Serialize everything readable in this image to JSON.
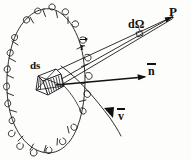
{
  "figure": {
    "background_color": "#fdfdfb",
    "ink_color": "#111111",
    "width": 191,
    "height": 161,
    "labels": {
      "point_p": "P",
      "solid_angle": "dΩ",
      "radius_vector": "r",
      "surface_element": "ds",
      "normal_vector": "n",
      "velocity_vector": "v"
    },
    "elements": {
      "loop": "scalloped-ellipse-loop",
      "surface_patch": "hatched-parallelogram",
      "cone": "narrow-cone-to-p",
      "aperture": "small-square-aperture",
      "normal_arrow": "horizontal-arrow-right",
      "velocity_arc": "curved-arc-with-arrowhead"
    }
  }
}
